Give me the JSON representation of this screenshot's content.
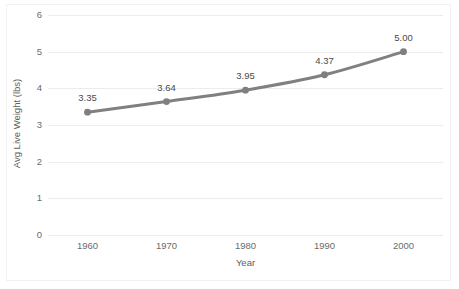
{
  "chart_data": {
    "type": "line",
    "title": "",
    "xlabel": "Year",
    "ylabel": "Avg Live Weight (lbs)",
    "categories": [
      "1960",
      "1970",
      "1980",
      "1990",
      "2000"
    ],
    "values": [
      3.35,
      3.64,
      3.95,
      4.37,
      5.0
    ],
    "data_labels": [
      "3.35",
      "3.64",
      "3.95",
      "4.37",
      "5.00"
    ],
    "series": [
      {
        "name": "Avg Live Weight (lbs)",
        "values": [
          3.35,
          3.64,
          3.95,
          4.37,
          5.0
        ]
      }
    ],
    "ylim": [
      0,
      6
    ],
    "y_ticks": [
      "0",
      "1",
      "2",
      "3",
      "4",
      "5",
      "6"
    ],
    "y_tick_values": [
      0,
      1,
      2,
      3,
      4,
      5,
      6
    ],
    "x_ticks": [
      "1960",
      "1970",
      "1980",
      "1990",
      "2000"
    ],
    "grid": "horizontal",
    "legend": "none",
    "markers": true,
    "colors": {
      "line": "#808080",
      "marker": "#7f7f7f",
      "gridline": "#ececec",
      "tick_text": "#6b6b6b",
      "axis_title_text": "#5e5e5e",
      "data_label_text": "#4a4a4a",
      "plot_background": "#ffffff",
      "frame_border": "#f2f2f2"
    }
  }
}
